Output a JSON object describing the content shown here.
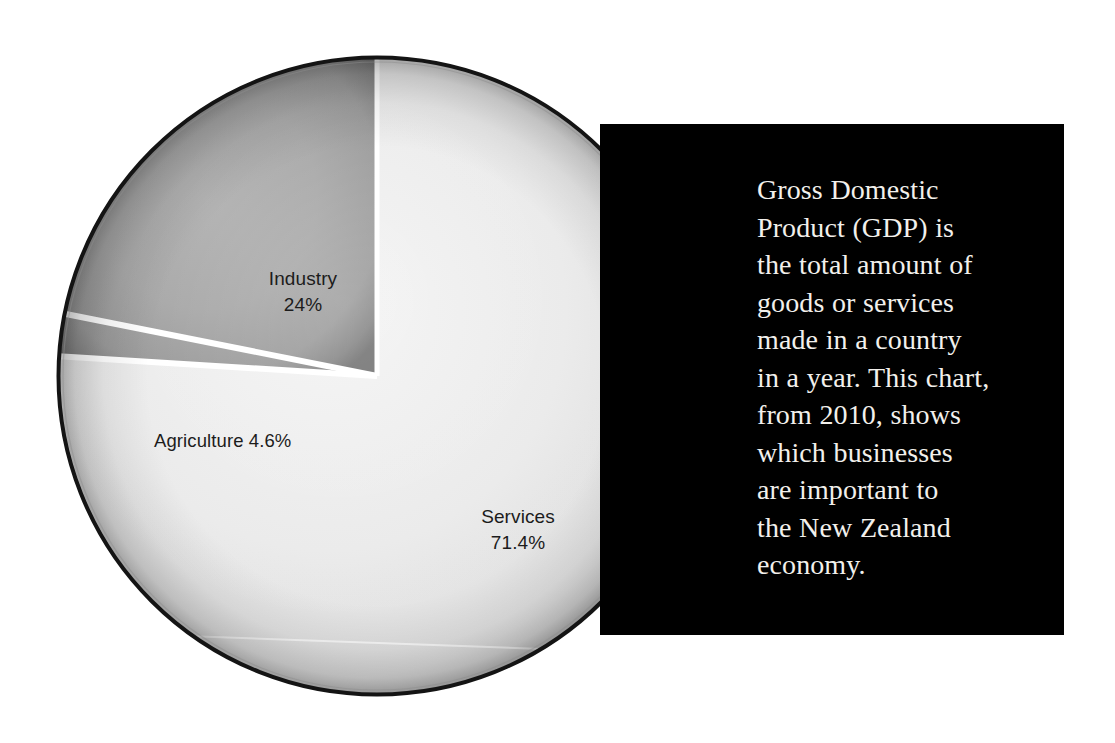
{
  "figure": {
    "background_color": "#ffffff",
    "width": 1115,
    "height": 743
  },
  "chart_data": {
    "type": "pie",
    "title": "",
    "subtitle": "",
    "xlabel": "",
    "ylabel": "",
    "legend_position": "none",
    "grid": false,
    "units": "percent of GDP",
    "year": 2010,
    "country": "New Zealand",
    "categories": [
      "Services",
      "Industry",
      "Agriculture"
    ],
    "values": [
      71.4,
      24.0,
      4.6
    ],
    "slices": [
      {
        "name": "Services",
        "value": 71.4,
        "label": "Services",
        "value_label": "71.4%",
        "color": "#e9e9e9",
        "start_angle_deg": 0,
        "end_angle_deg": 257.04
      },
      {
        "name": "Industry",
        "value": 24.0,
        "label": "Industry",
        "value_label": "24%",
        "color": "#9c9c9c",
        "start_angle_deg": 273.6,
        "end_angle_deg": 360
      },
      {
        "name": "Agriculture",
        "value": 4.6,
        "label": "Agriculture",
        "value_label": "4.6%",
        "color": "#dcdcdc",
        "start_angle_deg": 257.04,
        "end_angle_deg": 273.6
      }
    ],
    "annotations": [
      "Industry 24%",
      "Agriculture 4.6%",
      "Services 71.4%"
    ]
  },
  "pie": {
    "center_x": 322,
    "center_y": 322,
    "radius": 318,
    "rim_color": "#111111",
    "separator_color": "#ffffff",
    "separator_width": 5,
    "labels": {
      "industry_name": "Industry",
      "industry_value": "24%",
      "services_name": "Services",
      "services_value": "71.4%",
      "agriculture_combined": "Agriculture 4.6%"
    }
  },
  "text_panel": {
    "background_color": "#000000",
    "text_color": "#f2f0ec",
    "paragraph": "Gross Domestic Product (GDP) is the total amount of goods or services made in a country in a year. This chart, from 2010, shows which businesses are important to the New Zealand economy.",
    "lines": [
      "Gross Domestic",
      "Product (GDP) is",
      "the total amount of",
      "goods or services",
      "made in a country",
      "in a year. This chart,",
      "from 2010, shows",
      "which businesses",
      "are important to",
      "the New Zealand",
      "economy."
    ]
  }
}
